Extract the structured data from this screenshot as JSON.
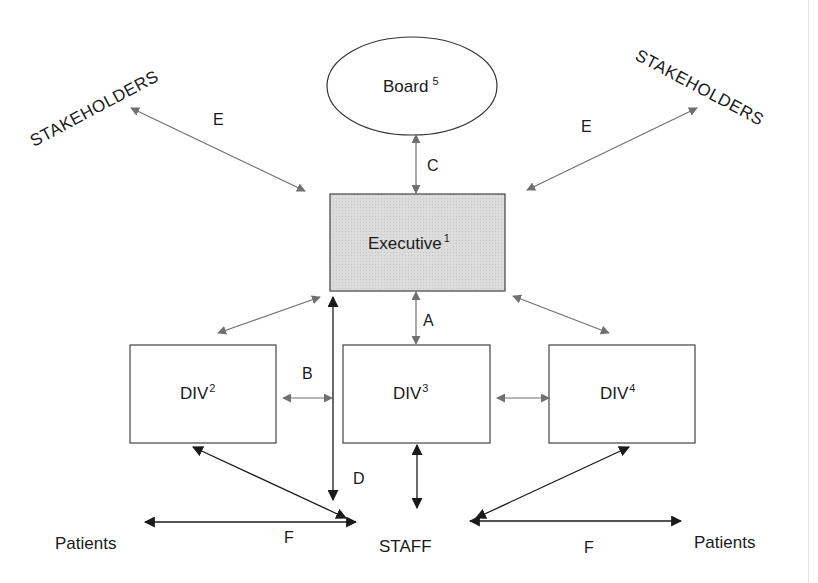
{
  "diagram": {
    "nodes": {
      "board": {
        "label": "Board",
        "sup": "5",
        "shape": "ellipse"
      },
      "executive": {
        "label": "Executive",
        "sup": "1",
        "shape": "rect",
        "fill": "#dcdcdc"
      },
      "div2": {
        "label": "DIV",
        "sup": "2",
        "shape": "rect"
      },
      "div3": {
        "label": "DIV",
        "sup": "3",
        "shape": "rect"
      },
      "div4": {
        "label": "DIV",
        "sup": "4",
        "shape": "rect"
      },
      "staff": {
        "label": "STAFF"
      },
      "stakeholders_left": {
        "label": "STAKEHOLDERS"
      },
      "stakeholders_right": {
        "label": "STAKEHOLDERS"
      },
      "patients_left": {
        "label": "Patients"
      },
      "patients_right": {
        "label": "Patients"
      }
    },
    "edge_labels": {
      "a": "A",
      "b": "B",
      "c": "C",
      "d": "D",
      "e_left": "E",
      "e_right": "E",
      "f_left": "F",
      "f_right": "F"
    },
    "colors": {
      "grey_arrow": "#707070",
      "black_arrow": "#1a1a1a",
      "executive_fill": "#dcdcdc"
    }
  }
}
